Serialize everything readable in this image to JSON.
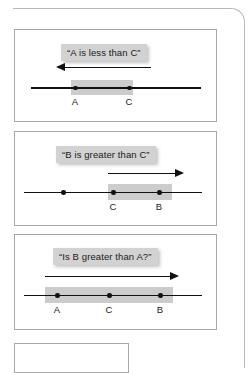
{
  "figure": {
    "panels": [
      {
        "id": "panel-1",
        "caption": "“A is less than C”",
        "arrow_direction": "left",
        "points": [
          {
            "label": "A",
            "labeled": true
          },
          {
            "label": "C",
            "labeled": true
          }
        ],
        "highlight_from": "A",
        "highlight_to": "C"
      },
      {
        "id": "panel-2",
        "caption": "“B is greater than C”",
        "arrow_direction": "right",
        "points": [
          {
            "label": "",
            "labeled": false
          },
          {
            "label": "C",
            "labeled": true
          },
          {
            "label": "B",
            "labeled": true
          }
        ],
        "highlight_from": "C",
        "highlight_to": "B"
      },
      {
        "id": "panel-3",
        "caption": "“Is B greater than A?”",
        "arrow_direction": "right",
        "points": [
          {
            "label": "A",
            "labeled": true
          },
          {
            "label": "C",
            "labeled": true
          },
          {
            "label": "B",
            "labeled": true
          }
        ],
        "highlight_from": "A",
        "highlight_to": "B"
      }
    ],
    "colors": {
      "caption_band": "#d2d2d2",
      "highlight_band": "#cccccc",
      "line": "#111111",
      "panel_border": "#a8a8a8",
      "frame_border": "#b9b9b9",
      "background": "#ffffff"
    }
  }
}
